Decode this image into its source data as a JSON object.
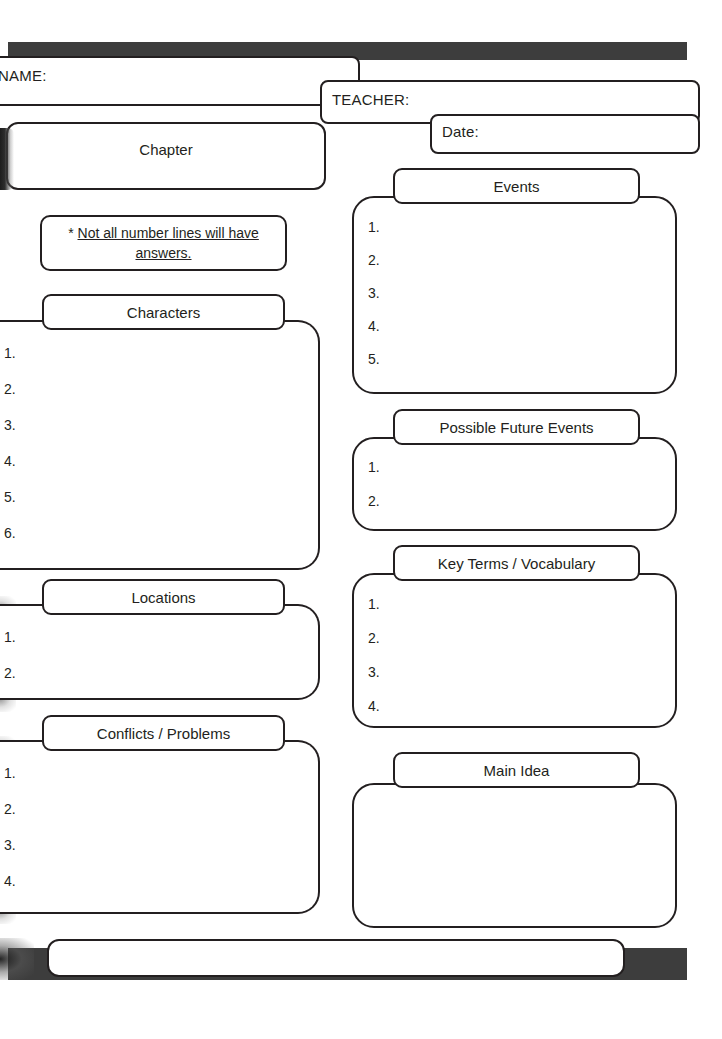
{
  "document": {
    "type": "worksheet",
    "title": "Chapter Reading Graphic Organizer"
  },
  "header": {
    "name_label": "NAME:",
    "teacher_label": "TEACHER:",
    "date_label": "Date:"
  },
  "chapter": {
    "label": "Chapter"
  },
  "note": {
    "asterisk": "* ",
    "line1": "Not all number lines will have",
    "line2": "answers."
  },
  "sections": {
    "characters": {
      "title": "Characters",
      "numbers": [
        "1.",
        "2.",
        "3.",
        "4.",
        "5.",
        "6."
      ]
    },
    "locations": {
      "title": "Locations",
      "numbers": [
        "1.",
        "2."
      ]
    },
    "conflicts": {
      "title": "Conflicts / Problems",
      "numbers": [
        "1.",
        "2.",
        "3.",
        "4."
      ]
    },
    "events": {
      "title": "Events",
      "numbers": [
        "1.",
        "2.",
        "3.",
        "4.",
        "5."
      ]
    },
    "future_events": {
      "title": "Possible Future Events",
      "numbers": [
        "1.",
        "2."
      ]
    },
    "key_terms": {
      "title": "Key Terms / Vocabulary",
      "numbers": [
        "1.",
        "2.",
        "3.",
        "4."
      ]
    },
    "main_idea": {
      "title": "Main Idea",
      "numbers": []
    }
  },
  "footer": {
    "box_text": ""
  },
  "colors": {
    "ink": "#231f20",
    "bar": "#3d3d3d",
    "paper": "#ffffff"
  }
}
